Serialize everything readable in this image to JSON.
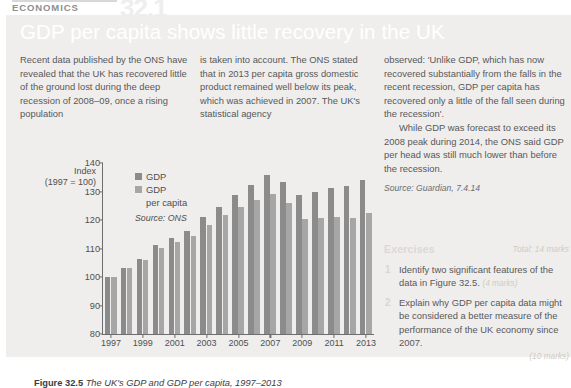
{
  "runhead": {
    "subject": "ECONOMICS",
    "chapter_number": "32.1"
  },
  "article": {
    "title": "GDP per capita shows little recovery in the UK",
    "col1_p1": "Recent data published by the ONS have revealed that the UK has recovered little of the ground lost during the deep recession of 2008–09, once a rising population",
    "col2_p1": "is taken into account. The ONS stated that in 2013 per capita gross domestic product remained well below its peak, which was achieved in 2007. The UK's statistical agency",
    "col3_p1": "observed: 'Unlike GDP, which has now recovered substantially from the falls in the recent recession, GDP per capita has recovered only a little of the fall seen during the recession'.",
    "col3_p2": "While GDP was forecast to exceed its 2008 peak during 2014, the ONS said GDP per head was still much lower than before the recession.",
    "source": "Source: Guardian, 7.4.14"
  },
  "exercises": {
    "heading": "Exercises",
    "total": "Total: 14 marks",
    "items": [
      {
        "num": "1",
        "text": "Identify two significant features of the data in Figure 32.5.",
        "marks": "(4 marks)",
        "marks_position": "inline"
      },
      {
        "num": "2",
        "text": "Explain why GDP per capita data might be considered a better measure of the performance of the UK economy since 2007.",
        "marks": "(10 marks)",
        "marks_position": "below"
      }
    ]
  },
  "caption": {
    "label": "Figure 32.5",
    "text": "The UK's GDP and GDP per capita, 1997–2013"
  },
  "chart_data": {
    "type": "bar",
    "title": "",
    "xlabel": "",
    "ylabel": "Index (1997 = 100)",
    "ylabel_line1": "Index",
    "ylabel_line2": "(1997 = 100)",
    "ylim": [
      80,
      140
    ],
    "yticks": [
      80,
      90,
      100,
      110,
      120,
      130,
      140
    ],
    "grid": false,
    "legend_position": "top-left inside plot",
    "source": "Source: ONS",
    "categories": [
      1997,
      1998,
      1999,
      2000,
      2001,
      2002,
      2003,
      2004,
      2005,
      2006,
      2007,
      2008,
      2009,
      2010,
      2011,
      2012,
      2013
    ],
    "xticks": [
      1997,
      1999,
      2001,
      2003,
      2005,
      2007,
      2009,
      2011,
      2013
    ],
    "series": [
      {
        "name": "GDP",
        "color": "#8b8b8b",
        "values": [
          100.0,
          103.3,
          106.4,
          111.1,
          113.6,
          116.2,
          120.9,
          124.7,
          128.7,
          132.4,
          135.9,
          133.4,
          128.7,
          130.0,
          131.3,
          131.8,
          133.9
        ]
      },
      {
        "name": "GDP per capita",
        "color": "#a6a6a6",
        "values": [
          100.0,
          103.0,
          105.8,
          110.2,
          112.2,
          114.4,
          118.3,
          121.6,
          124.5,
          126.9,
          129.1,
          125.8,
          120.3,
          120.6,
          121.1,
          120.8,
          122.4
        ]
      }
    ]
  },
  "legend": {
    "item1": "GDP",
    "item2_line1": "GDP",
    "item2_line2": "per capita"
  }
}
